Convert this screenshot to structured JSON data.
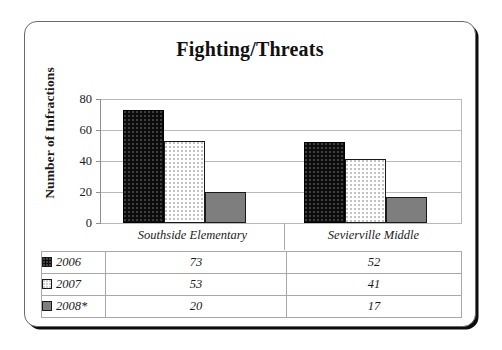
{
  "chart_data": {
    "type": "bar",
    "title": "Fighting/Threats",
    "xlabel": "",
    "ylabel": "Number of Infractions",
    "categories": [
      "Southside Elementary",
      "Sevierville Middle"
    ],
    "series": [
      {
        "name": "2006",
        "values": [
          73,
          52
        ],
        "color": "#0c0c0c",
        "swatch": "black-dotted-swatch"
      },
      {
        "name": "2007",
        "values": [
          53,
          41
        ],
        "color": "#ffffff",
        "swatch": "white-dotted-swatch"
      },
      {
        "name": "2008*",
        "values": [
          20,
          17
        ],
        "color": "#7e7e7e",
        "swatch": "gray-swatch"
      }
    ],
    "ylim": [
      0,
      80
    ],
    "yticks": [
      0,
      20,
      40,
      60,
      80
    ],
    "ytick_labels": [
      "0",
      "20",
      "40",
      "60",
      "80"
    ],
    "grid": true,
    "legend_position": "table-below"
  },
  "table": {
    "rows": [
      {
        "label": "2006",
        "cells": [
          "73",
          "52"
        ]
      },
      {
        "label": "2007",
        "cells": [
          "53",
          "41"
        ]
      },
      {
        "label": "2008*",
        "cells": [
          "20",
          "17"
        ]
      }
    ]
  }
}
